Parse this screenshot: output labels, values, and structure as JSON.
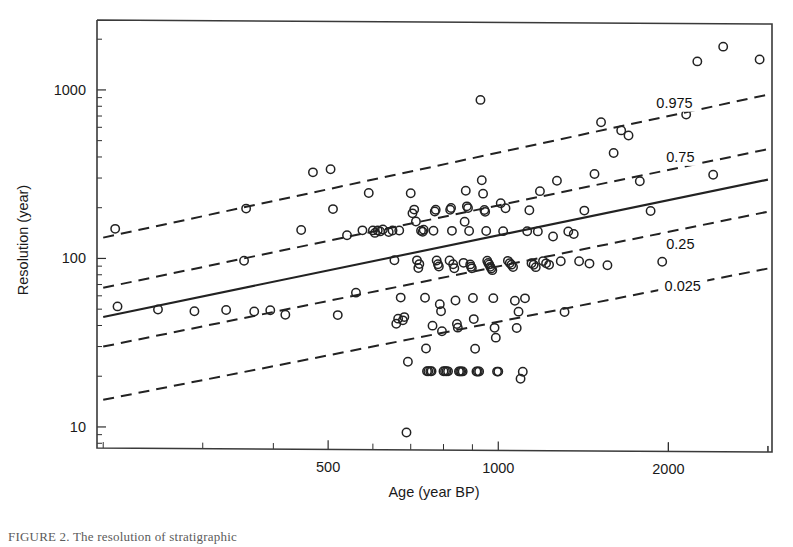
{
  "figure": {
    "caption_partial": "FIGURE 2.   The resolution of stratigraphic"
  },
  "chart_data": {
    "type": "scatter",
    "title": "",
    "xlabel": "Age (year BP)",
    "ylabel": "Resolution (year)",
    "xscale": "log",
    "yscale": "log",
    "xlim": [
      195,
      3050
    ],
    "ylim": [
      7.5,
      2600
    ],
    "xticks": [
      500,
      1000,
      2000
    ],
    "xtick_labels": [
      "500",
      "1000",
      "2000"
    ],
    "yticks": [
      10,
      100,
      1000
    ],
    "ytick_labels": [
      "10",
      "100",
      "1000"
    ],
    "grid": false,
    "legend": "none",
    "marker": "open-circle",
    "annotations": [
      {
        "text": "0.975",
        "x": 2050,
        "y": 880
      },
      {
        "text": "0.75",
        "x": 2100,
        "y": 420
      },
      {
        "text": "0.25",
        "x": 2100,
        "y": 128
      },
      {
        "text": "0.025",
        "x": 2120,
        "y": 72
      }
    ],
    "fit_lines": [
      {
        "name": "median-regression",
        "style": "solid",
        "quantile": 0.5,
        "x": [
          200,
          3000
        ],
        "y": [
          45,
          310
        ]
      },
      {
        "name": "quantile-0.975",
        "style": "dashed",
        "quantile": 0.975,
        "x": [
          200,
          3000
        ],
        "y": [
          133,
          990
        ]
      },
      {
        "name": "quantile-0.75",
        "style": "dashed",
        "quantile": 0.75,
        "x": [
          200,
          3000
        ],
        "y": [
          67,
          470
        ]
      },
      {
        "name": "quantile-0.25",
        "style": "dashed",
        "quantile": 0.25,
        "x": [
          200,
          3000
        ],
        "y": [
          30,
          200
        ]
      },
      {
        "name": "quantile-0.025",
        "style": "dashed",
        "quantile": 0.025,
        "x": [
          200,
          3000
        ],
        "y": [
          14.5,
          92
        ]
      }
    ],
    "points": [
      [
        210,
        150
      ],
      [
        212,
        52
      ],
      [
        250,
        50
      ],
      [
        290,
        49
      ],
      [
        330,
        50
      ],
      [
        355,
        98
      ],
      [
        358,
        200
      ],
      [
        370,
        49
      ],
      [
        395,
        50
      ],
      [
        420,
        47
      ],
      [
        448,
        150
      ],
      [
        470,
        330
      ],
      [
        505,
        345
      ],
      [
        510,
        200
      ],
      [
        520,
        47
      ],
      [
        540,
        140
      ],
      [
        560,
        64
      ],
      [
        575,
        150
      ],
      [
        590,
        250
      ],
      [
        600,
        150
      ],
      [
        605,
        145
      ],
      [
        612,
        150
      ],
      [
        618,
        148
      ],
      [
        625,
        152
      ],
      [
        640,
        147
      ],
      [
        650,
        150
      ],
      [
        655,
        100
      ],
      [
        660,
        42
      ],
      [
        665,
        45
      ],
      [
        668,
        150
      ],
      [
        672,
        60
      ],
      [
        678,
        44
      ],
      [
        682,
        46
      ],
      [
        688,
        9.5
      ],
      [
        692,
        25
      ],
      [
        700,
        250
      ],
      [
        705,
        190
      ],
      [
        710,
        200
      ],
      [
        715,
        170
      ],
      [
        718,
        100
      ],
      [
        722,
        90
      ],
      [
        725,
        95
      ],
      [
        730,
        150
      ],
      [
        735,
        148
      ],
      [
        738,
        152
      ],
      [
        742,
        60
      ],
      [
        745,
        30
      ],
      [
        748,
        22
      ],
      [
        752,
        22
      ],
      [
        758,
        22
      ],
      [
        762,
        22
      ],
      [
        765,
        41
      ],
      [
        768,
        150
      ],
      [
        772,
        195
      ],
      [
        775,
        200
      ],
      [
        778,
        100
      ],
      [
        782,
        95
      ],
      [
        785,
        92
      ],
      [
        788,
        55
      ],
      [
        792,
        50
      ],
      [
        795,
        38
      ],
      [
        800,
        22
      ],
      [
        805,
        22
      ],
      [
        810,
        22
      ],
      [
        815,
        22
      ],
      [
        820,
        100
      ],
      [
        822,
        200
      ],
      [
        825,
        205
      ],
      [
        828,
        150
      ],
      [
        832,
        95
      ],
      [
        836,
        90
      ],
      [
        840,
        58
      ],
      [
        845,
        42
      ],
      [
        848,
        40
      ],
      [
        852,
        22
      ],
      [
        856,
        22
      ],
      [
        860,
        22
      ],
      [
        865,
        22
      ],
      [
        868,
        97
      ],
      [
        872,
        170
      ],
      [
        876,
        260
      ],
      [
        880,
        210
      ],
      [
        884,
        205
      ],
      [
        888,
        150
      ],
      [
        892,
        95
      ],
      [
        895,
        92
      ],
      [
        898,
        90
      ],
      [
        902,
        60
      ],
      [
        905,
        45
      ],
      [
        910,
        30
      ],
      [
        915,
        22
      ],
      [
        920,
        22
      ],
      [
        925,
        22
      ],
      [
        930,
        900
      ],
      [
        935,
        300
      ],
      [
        940,
        250
      ],
      [
        945,
        200
      ],
      [
        948,
        195
      ],
      [
        952,
        150
      ],
      [
        956,
        100
      ],
      [
        960,
        97
      ],
      [
        964,
        95
      ],
      [
        968,
        92
      ],
      [
        972,
        90
      ],
      [
        976,
        88
      ],
      [
        980,
        60
      ],
      [
        985,
        40
      ],
      [
        990,
        35
      ],
      [
        995,
        22
      ],
      [
        1000,
        22
      ],
      [
        1010,
        220
      ],
      [
        1020,
        150
      ],
      [
        1030,
        205
      ],
      [
        1040,
        100
      ],
      [
        1048,
        97
      ],
      [
        1055,
        95
      ],
      [
        1062,
        92
      ],
      [
        1070,
        58
      ],
      [
        1078,
        40
      ],
      [
        1086,
        50
      ],
      [
        1095,
        20
      ],
      [
        1105,
        22
      ],
      [
        1115,
        60
      ],
      [
        1125,
        150
      ],
      [
        1135,
        200
      ],
      [
        1145,
        97
      ],
      [
        1155,
        95
      ],
      [
        1165,
        92
      ],
      [
        1175,
        150
      ],
      [
        1185,
        260
      ],
      [
        1200,
        100
      ],
      [
        1215,
        97
      ],
      [
        1230,
        95
      ],
      [
        1250,
        140
      ],
      [
        1270,
        300
      ],
      [
        1290,
        100
      ],
      [
        1310,
        50
      ],
      [
        1330,
        150
      ],
      [
        1360,
        145
      ],
      [
        1390,
        100
      ],
      [
        1420,
        200
      ],
      [
        1450,
        97
      ],
      [
        1480,
        330
      ],
      [
        1520,
        670
      ],
      [
        1560,
        95
      ],
      [
        1600,
        440
      ],
      [
        1650,
        600
      ],
      [
        1700,
        560
      ],
      [
        1780,
        300
      ],
      [
        1860,
        200
      ],
      [
        1950,
        100
      ],
      [
        2050,
        440
      ],
      [
        2150,
        750
      ],
      [
        2250,
        1550
      ],
      [
        2400,
        330
      ],
      [
        2500,
        1900
      ],
      [
        2900,
        1600
      ]
    ]
  }
}
